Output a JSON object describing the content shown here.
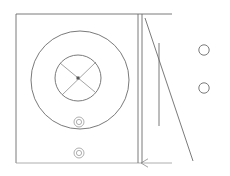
{
  "drawing": {
    "title": "Mechanical part line drawing",
    "background_color": "#ffffff",
    "line_color": "#6b6b6b",
    "faint_line_color": "#9a9a9a",
    "hub_color": "#555555",
    "canvas": {
      "width": 230,
      "height": 176
    }
  },
  "plate": {
    "name": "rectangular-plate-outline",
    "x": 16,
    "y": 14,
    "width": 125,
    "height": 149,
    "top_edge_extension_x": 172
  },
  "outer_circle": {
    "name": "outer-bore-circle",
    "cx": 80,
    "cy": 80,
    "r": 49
  },
  "inner_circle": {
    "name": "inner-bore-circle",
    "cx": 78,
    "cy": 78,
    "r": 23
  },
  "spokes": {
    "name": "cross-spokes",
    "hub_cx": 78,
    "hub_cy": 78,
    "hub_size": 3,
    "lines": [
      {
        "x1": 60,
        "y1": 63,
        "x2": 95,
        "y2": 92
      },
      {
        "x1": 96,
        "y1": 62,
        "x2": 62,
        "y2": 95
      }
    ]
  },
  "fasteners": [
    {
      "name": "fastener-hole-upper",
      "cx": 79,
      "cy": 122,
      "r_outer": 5,
      "r_inner": 2.6
    },
    {
      "name": "fastener-hole-lower",
      "cx": 79,
      "cy": 153,
      "r_outer": 5,
      "r_inner": 2.6
    }
  ],
  "edge_lines": {
    "name": "plate-edge-double-line",
    "left_x": 138,
    "right_x": 142,
    "top_y": 14,
    "bottom_y": 163
  },
  "right_circles": [
    {
      "name": "detail-circle-upper",
      "cx": 204,
      "cy": 50,
      "r": 5.2
    },
    {
      "name": "detail-circle-lower",
      "cx": 204,
      "cy": 88,
      "r": 5.2
    }
  ],
  "guides": {
    "long_diagonal": {
      "name": "long-diagonal-line",
      "x1": 145,
      "y1": 18,
      "x2": 193,
      "y2": 161
    },
    "short_vertical": {
      "name": "short-vertical-line",
      "x1": 159,
      "y1": 43,
      "x2": 159,
      "y2": 126
    },
    "bottom_rule": {
      "name": "bottom-horizontal-rule",
      "x1": 16,
      "y1": 163,
      "x2": 172,
      "y2": 163
    },
    "arrow_head": {
      "name": "bottom-arrow-marker",
      "tip_x": 141,
      "tip_y": 163,
      "size": 7
    }
  },
  "labels": {
    "figure_caption": "",
    "dimension_text": ""
  }
}
